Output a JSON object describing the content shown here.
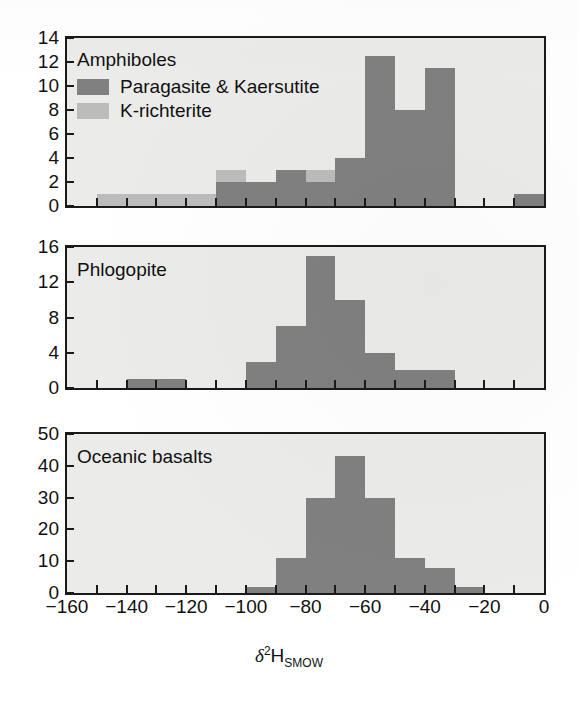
{
  "figure": {
    "xlabel_delta": "δ",
    "xlabel_sup": "2",
    "xlabel_h": "H",
    "xlabel_sub": "SMOW",
    "x_axis": {
      "min": -160,
      "max": 0,
      "tick_step": 10,
      "label_step": 20,
      "tick_labels": [
        "−160",
        "−140",
        "−120",
        "−100",
        "−80",
        "−60",
        "−40",
        "−20",
        "0"
      ],
      "tick_values": [
        -160,
        -140,
        -120,
        -100,
        -80,
        -60,
        -40,
        -20,
        0
      ]
    },
    "colors": {
      "dark_gray": "#808080",
      "light_gray": "#bcbcbc",
      "plot_background": "#ebebe9",
      "axis": "#1a1a1a",
      "page_background": "#ffffff"
    }
  },
  "chart_data": [
    {
      "type": "bar",
      "title": "Amphiboles",
      "xlabel": "δ2H_SMOW",
      "ylabel": "",
      "xlim": [
        -160,
        0
      ],
      "ylim": [
        0,
        14
      ],
      "ytick_step": 2,
      "ytick_labels": [
        "0",
        "2",
        "4",
        "6",
        "8",
        "10",
        "12",
        "14"
      ],
      "ytick_values": [
        0,
        2,
        4,
        6,
        8,
        10,
        12,
        14
      ],
      "grid": false,
      "stacked": true,
      "bin_width": 10,
      "bin_starts": [
        -160,
        -150,
        -140,
        -130,
        -120,
        -110,
        -100,
        -90,
        -80,
        -70,
        -60,
        -50,
        -40,
        -30,
        -20,
        -10
      ],
      "legend_position": "upper-left",
      "series": [
        {
          "name": "Paragasite & Kaersutite",
          "color": "#808080",
          "values": [
            0,
            0,
            0,
            0,
            0,
            2,
            2,
            3,
            2,
            4,
            12.5,
            8,
            11.5,
            0,
            0,
            1
          ]
        },
        {
          "name": "K-richterite",
          "color": "#bcbcbc",
          "values": [
            0,
            1,
            1,
            1,
            1,
            1,
            0,
            0,
            1,
            0,
            0,
            0,
            0,
            0,
            0,
            0
          ]
        }
      ]
    },
    {
      "type": "bar",
      "title": "Phlogopite",
      "xlabel": "δ2H_SMOW",
      "ylabel": "",
      "xlim": [
        -160,
        0
      ],
      "ylim": [
        0,
        16
      ],
      "ytick_step": 4,
      "ytick_labels": [
        "0",
        "4",
        "8",
        "12",
        "16"
      ],
      "ytick_values": [
        0,
        4,
        8,
        12,
        16
      ],
      "grid": false,
      "stacked": false,
      "bin_width": 10,
      "bin_starts": [
        -160,
        -150,
        -140,
        -130,
        -120,
        -110,
        -100,
        -90,
        -80,
        -70,
        -60,
        -50,
        -40,
        -30,
        -20,
        -10
      ],
      "legend_position": "none",
      "series": [
        {
          "name": "Phlogopite",
          "color": "#808080",
          "values": [
            0,
            0,
            1,
            1,
            0,
            0,
            3,
            7,
            15,
            10,
            4,
            2,
            2,
            0,
            0,
            0
          ]
        }
      ]
    },
    {
      "type": "bar",
      "title": "Oceanic basalts",
      "xlabel": "δ2H_SMOW",
      "ylabel": "",
      "xlim": [
        -160,
        0
      ],
      "ylim": [
        0,
        50
      ],
      "ytick_step": 10,
      "ytick_labels": [
        "0",
        "10",
        "20",
        "30",
        "40",
        "50"
      ],
      "ytick_values": [
        0,
        10,
        20,
        30,
        40,
        50
      ],
      "grid": false,
      "stacked": false,
      "bin_width": 10,
      "bin_starts": [
        -160,
        -150,
        -140,
        -130,
        -120,
        -110,
        -100,
        -90,
        -80,
        -70,
        -60,
        -50,
        -40,
        -30,
        -20,
        -10
      ],
      "legend_position": "none",
      "series": [
        {
          "name": "Oceanic basalts",
          "color": "#808080",
          "values": [
            0,
            0,
            0,
            0,
            0,
            0,
            2,
            11,
            30,
            43,
            30,
            11,
            8,
            2,
            0,
            0
          ]
        }
      ]
    }
  ],
  "panels": [
    {
      "title": "Amphiboles",
      "legend": [
        {
          "label": "Paragasite & Kaersutite",
          "swatch": "dark"
        },
        {
          "label": "K-richterite",
          "swatch": "light"
        }
      ]
    },
    {
      "title": "Phlogopite",
      "legend": []
    },
    {
      "title": "Oceanic basalts",
      "legend": []
    }
  ]
}
